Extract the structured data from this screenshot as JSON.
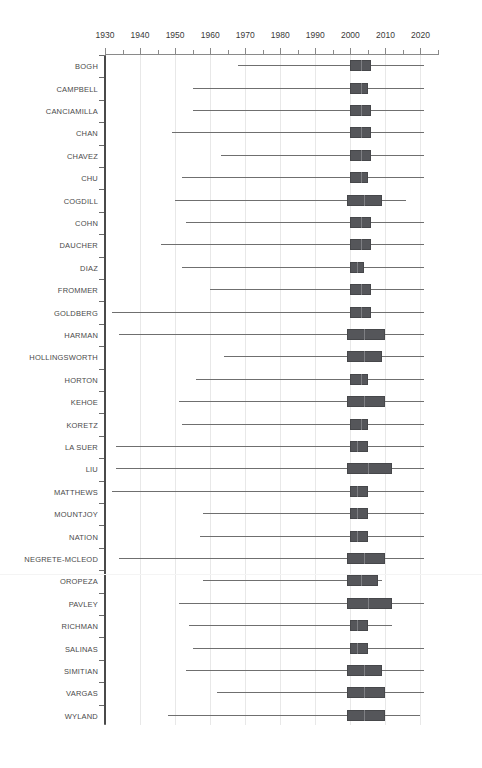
{
  "title": "",
  "chart_data": {
    "type": "box",
    "title": "",
    "xlabel": "",
    "ylabel": "",
    "xlim": [
      1930,
      2025
    ],
    "x_ticks_major": [
      1930,
      1940,
      1950,
      1960,
      1970,
      1980,
      1990,
      2000,
      2010,
      2020
    ],
    "x_ticks_minor": [
      1935,
      1945,
      1955,
      1965,
      1975,
      1985,
      1995,
      2005,
      2015,
      2025
    ],
    "grid": "vertical",
    "legend": "none",
    "orientation": "horizontal",
    "box_color": "#55565a",
    "whisker_color": "#6f6f6f",
    "grid_color": "#e8e8e8",
    "axis_color": "#8a8a8a",
    "categories": [
      "BOGH",
      "CAMPBELL",
      "CANCIAMILLA",
      "CHAN",
      "CHAVEZ",
      "CHU",
      "COGDILL",
      "COHN",
      "DAUCHER",
      "DIAZ",
      "FROMMER",
      "GOLDBERG",
      "HARMAN",
      "HOLLINGSWORTH",
      "HORTON",
      "KEHOE",
      "KORETZ",
      "LA SUER",
      "LIU",
      "MATTHEWS",
      "MOUNTJOY",
      "NATION",
      "NEGRETE-MCLEOD",
      "OROPEZA",
      "PAVLEY",
      "RICHMAN",
      "SALINAS",
      "SIMITIAN",
      "VARGAS",
      "WYLAND"
    ],
    "boxes": [
      {
        "name": "BOGH",
        "whisker_low": 1968,
        "q1": 2000,
        "median": 2003,
        "q3": 2006,
        "whisker_high": 2021
      },
      {
        "name": "CAMPBELL",
        "whisker_low": 1955,
        "q1": 2000,
        "median": 2003,
        "q3": 2005,
        "whisker_high": 2021
      },
      {
        "name": "CANCIAMILLA",
        "whisker_low": 1955,
        "q1": 2000,
        "median": 2003,
        "q3": 2006,
        "whisker_high": 2021
      },
      {
        "name": "CHAN",
        "whisker_low": 1949,
        "q1": 2000,
        "median": 2003,
        "q3": 2006,
        "whisker_high": 2021
      },
      {
        "name": "CHAVEZ",
        "whisker_low": 1963,
        "q1": 2000,
        "median": 2003,
        "q3": 2006,
        "whisker_high": 2021
      },
      {
        "name": "CHU",
        "whisker_low": 1952,
        "q1": 2000,
        "median": 2003,
        "q3": 2005,
        "whisker_high": 2021
      },
      {
        "name": "COGDILL",
        "whisker_low": 1950,
        "q1": 1999,
        "median": 2004,
        "q3": 2009,
        "whisker_high": 2016
      },
      {
        "name": "COHN",
        "whisker_low": 1953,
        "q1": 2000,
        "median": 2003,
        "q3": 2006,
        "whisker_high": 2021
      },
      {
        "name": "DAUCHER",
        "whisker_low": 1946,
        "q1": 2000,
        "median": 2003,
        "q3": 2006,
        "whisker_high": 2021
      },
      {
        "name": "DIAZ",
        "whisker_low": 1952,
        "q1": 2000,
        "median": 2002,
        "q3": 2004,
        "whisker_high": 2021
      },
      {
        "name": "FROMMER",
        "whisker_low": 1960,
        "q1": 2000,
        "median": 2003,
        "q3": 2006,
        "whisker_high": 2021
      },
      {
        "name": "GOLDBERG",
        "whisker_low": 1932,
        "q1": 2000,
        "median": 2003,
        "q3": 2006,
        "whisker_high": 2021
      },
      {
        "name": "HARMAN",
        "whisker_low": 1934,
        "q1": 1999,
        "median": 2004,
        "q3": 2010,
        "whisker_high": 2021
      },
      {
        "name": "HOLLINGSWORTH",
        "whisker_low": 1964,
        "q1": 1999,
        "median": 2004,
        "q3": 2009,
        "whisker_high": 2021
      },
      {
        "name": "HORTON",
        "whisker_low": 1956,
        "q1": 2000,
        "median": 2003,
        "q3": 2005,
        "whisker_high": 2021
      },
      {
        "name": "KEHOE",
        "whisker_low": 1951,
        "q1": 1999,
        "median": 2004,
        "q3": 2010,
        "whisker_high": 2021
      },
      {
        "name": "KORETZ",
        "whisker_low": 1952,
        "q1": 2000,
        "median": 2003,
        "q3": 2005,
        "whisker_high": 2021
      },
      {
        "name": "LA SUER",
        "whisker_low": 1933,
        "q1": 2000,
        "median": 2002,
        "q3": 2005,
        "whisker_high": 2021
      },
      {
        "name": "LIU",
        "whisker_low": 1933,
        "q1": 1999,
        "median": 2005,
        "q3": 2012,
        "whisker_high": 2021
      },
      {
        "name": "MATTHEWS",
        "whisker_low": 1932,
        "q1": 2000,
        "median": 2002,
        "q3": 2005,
        "whisker_high": 2021
      },
      {
        "name": "MOUNTJOY",
        "whisker_low": 1958,
        "q1": 2000,
        "median": 2002,
        "q3": 2005,
        "whisker_high": 2021
      },
      {
        "name": "NATION",
        "whisker_low": 1957,
        "q1": 2000,
        "median": 2002,
        "q3": 2005,
        "whisker_high": 2021
      },
      {
        "name": "NEGRETE-MCLEOD",
        "whisker_low": 1934,
        "q1": 1999,
        "median": 2004,
        "q3": 2010,
        "whisker_high": 2021
      },
      {
        "name": "OROPEZA",
        "whisker_low": 1958,
        "q1": 1999,
        "median": 2003,
        "q3": 2008,
        "whisker_high": 2009
      },
      {
        "name": "PAVLEY",
        "whisker_low": 1951,
        "q1": 1999,
        "median": 2005,
        "q3": 2012,
        "whisker_high": 2021
      },
      {
        "name": "RICHMAN",
        "whisker_low": 1954,
        "q1": 2000,
        "median": 2002,
        "q3": 2005,
        "whisker_high": 2012
      },
      {
        "name": "SALINAS",
        "whisker_low": 1955,
        "q1": 2000,
        "median": 2002,
        "q3": 2005,
        "whisker_high": 2021
      },
      {
        "name": "SIMITIAN",
        "whisker_low": 1953,
        "q1": 1999,
        "median": 2004,
        "q3": 2009,
        "whisker_high": 2021
      },
      {
        "name": "VARGAS",
        "whisker_low": 1962,
        "q1": 1999,
        "median": 2004,
        "q3": 2010,
        "whisker_high": 2021
      },
      {
        "name": "WYLAND",
        "whisker_low": 1948,
        "q1": 1999,
        "median": 2004,
        "q3": 2010,
        "whisker_high": 2020
      }
    ]
  }
}
